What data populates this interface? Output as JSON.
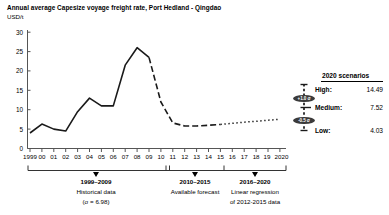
{
  "header": {
    "title": "Annual average Capesize voyage freight rate, Port Hedland - Qingdao",
    "unit": "USD/t"
  },
  "scenarios": {
    "title": "2020 scenarios",
    "rows": [
      {
        "name": "High:",
        "value": "14.49"
      },
      {
        "name": "Medium:",
        "value": "7.52"
      },
      {
        "name": "Low:",
        "value": "4.03"
      }
    ],
    "badges": [
      {
        "label": "+1.0 σ"
      },
      {
        "label": "-0.5 σ"
      }
    ]
  },
  "periods": [
    {
      "range": "1999–2009",
      "desc": "Historical data",
      "note": "(σ = 6.98)"
    },
    {
      "range": "2010–2015",
      "desc": "Available forecast",
      "note": ""
    },
    {
      "range": "2016–2020",
      "desc": "Linear regression",
      "note": "of 2012-2015 data"
    }
  ],
  "chart_data": {
    "type": "line",
    "title": "Annual average Capesize voyage freight rate, Port Hedland - Qingdao",
    "xlabel": "",
    "ylabel": "USD/t",
    "ylim": [
      0,
      30
    ],
    "yticks": [
      0,
      5,
      10,
      15,
      20,
      25,
      30
    ],
    "grid": false,
    "legend_position": "none",
    "x": [
      "1999",
      "00",
      "01",
      "02",
      "03",
      "04",
      "05",
      "06",
      "07",
      "08",
      "09",
      "10",
      "11",
      "12",
      "13",
      "14",
      "15",
      "16",
      "17",
      "18",
      "19",
      "2020"
    ],
    "series": [
      {
        "name": "Historical data",
        "style": "solid",
        "x": [
          "1999",
          "00",
          "01",
          "02",
          "03",
          "04",
          "05",
          "06",
          "07",
          "08",
          "09"
        ],
        "values": [
          4.0,
          6.3,
          5.0,
          4.5,
          9.5,
          13.0,
          11.0,
          11.0,
          21.5,
          26.0,
          23.5
        ]
      },
      {
        "name": "Available forecast",
        "style": "dashed",
        "x": [
          "09",
          "10",
          "11",
          "12",
          "13",
          "14",
          "15"
        ],
        "values": [
          23.5,
          12.0,
          6.6,
          5.8,
          5.8,
          6.0,
          6.2
        ]
      },
      {
        "name": "Linear regression of 2012-2015 data",
        "style": "dotted",
        "x": [
          "15",
          "16",
          "17",
          "18",
          "19",
          "2020"
        ],
        "values": [
          6.2,
          6.5,
          6.8,
          7.0,
          7.3,
          7.52
        ]
      }
    ],
    "annotations": [
      {
        "label": "High",
        "value": 14.49
      },
      {
        "label": "Medium",
        "value": 7.52
      },
      {
        "label": "Low",
        "value": 4.03
      }
    ]
  },
  "colors": {
    "line": "#1a1a1a",
    "axis": "#555555",
    "badge": "#3b3b3b"
  }
}
